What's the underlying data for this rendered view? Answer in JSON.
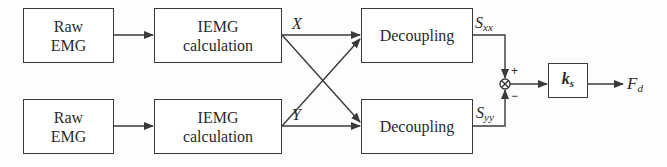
{
  "diagram": {
    "type": "signal-flow block diagram",
    "top_row": {
      "raw": {
        "line1": "Raw",
        "line2": "EMG"
      },
      "iemg": {
        "line1": "IEMG",
        "line2": "calculation"
      },
      "output_label": "X",
      "decoupling": {
        "label": "Decoupling"
      },
      "signal": {
        "base": "S",
        "sub": "xx"
      }
    },
    "bottom_row": {
      "raw": {
        "line1": "Raw",
        "line2": "EMG"
      },
      "iemg": {
        "line1": "IEMG",
        "line2": "calculation"
      },
      "output_label": "Y",
      "decoupling": {
        "label": "Decoupling"
      },
      "signal": {
        "base": "S",
        "sub": "yy"
      }
    },
    "summing_junction": {
      "symbol": "⊗",
      "plus": "+",
      "minus": "−"
    },
    "gain": {
      "base": "k",
      "sub": "s"
    },
    "output": {
      "base": "F",
      "sub": "d"
    },
    "colors": {
      "line": "#3a3a3a",
      "text": "#2a2a2a",
      "background": "#fdfdfd"
    }
  }
}
